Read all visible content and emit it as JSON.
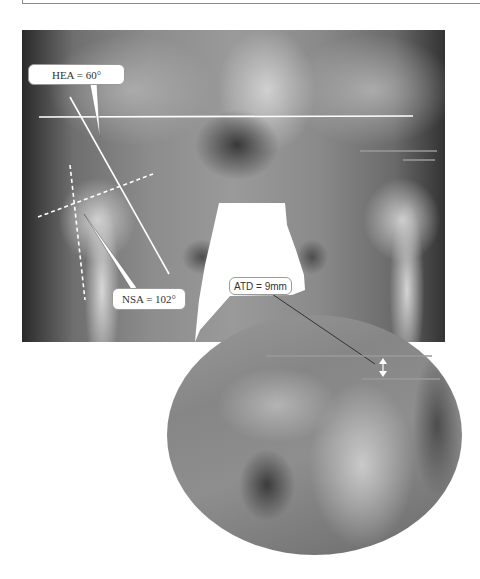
{
  "figure": {
    "annotations": {
      "hea": {
        "label": "HEA = 60°",
        "name": "Hilgenreiner epiphyseal angle"
      },
      "nsa": {
        "label": "NSA = 102°",
        "name": "Neck-shaft angle"
      },
      "atd": {
        "label": "ATD = 9mm",
        "name": "Articulotrochanteric distance"
      }
    },
    "colors": {
      "annotation_line": "#ffffff",
      "measure_line": "#9a9a9a",
      "label_bg": "#ffffff",
      "label_text": "#333333",
      "background": "#ffffff"
    }
  }
}
